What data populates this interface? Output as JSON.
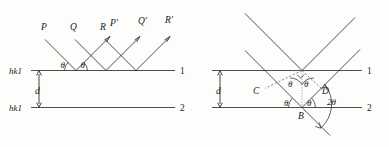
{
  "figure": {
    "stroke_color": "#3a3a3a",
    "background": "#fdfdfc"
  },
  "left_panel": {
    "plane_labels": {
      "top": "hk1",
      "bottom": "hk1"
    },
    "line_numbers": {
      "top": "1",
      "bottom": "2"
    },
    "spacing_label": "d",
    "incident_rays": [
      {
        "name": "P",
        "label": "P"
      },
      {
        "name": "Q",
        "label": "Q"
      },
      {
        "name": "R",
        "label": "R"
      }
    ],
    "reflected_rays": [
      {
        "name": "P-prime",
        "label": "P′"
      },
      {
        "name": "Q-prime",
        "label": "Q′"
      },
      {
        "name": "R-prime",
        "label": "R′"
      }
    ],
    "angle_labels": [
      {
        "name": "theta-incident",
        "label": "θ"
      },
      {
        "name": "theta-reflected",
        "label": "θ"
      }
    ]
  },
  "right_panel": {
    "line_numbers": {
      "top": "1",
      "bottom": "2"
    },
    "spacing_label": "d",
    "point_labels": [
      {
        "name": "point-C",
        "label": "C"
      },
      {
        "name": "point-D",
        "label": "D"
      },
      {
        "name": "point-B",
        "label": "B"
      }
    ],
    "angle_labels": [
      {
        "name": "theta-upper-left",
        "label": "θ"
      },
      {
        "name": "theta-upper-right",
        "label": "θ"
      },
      {
        "name": "theta-lower-left",
        "label": "θ"
      },
      {
        "name": "theta-lower-right",
        "label": "θ"
      },
      {
        "name": "two-theta",
        "label": "2θ"
      }
    ]
  }
}
